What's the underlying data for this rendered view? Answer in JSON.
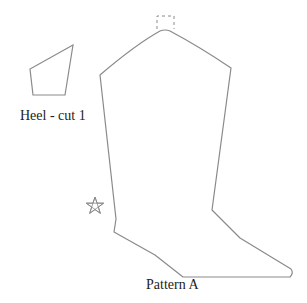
{
  "diagram": {
    "type": "sewing-pattern",
    "stroke_color": "#8a8a8a",
    "text_color": "#222222",
    "pieces": [
      {
        "name": "heel",
        "label": "Heel - cut 1",
        "shape": "quadrilateral",
        "points": [
          [
            73,
            45
          ],
          [
            30,
            69
          ],
          [
            33,
            95
          ],
          [
            65,
            95
          ]
        ]
      },
      {
        "name": "boot-pattern",
        "label": "Pattern A",
        "shape": "boot-outline",
        "notch": "dashed rectangle at top center",
        "marker": "star",
        "points": [
          [
            100,
            75
          ],
          [
            140,
            43
          ],
          [
            160,
            30
          ],
          [
            170,
            30
          ],
          [
            190,
            42
          ],
          [
            231,
            68
          ],
          [
            212,
            210
          ],
          [
            240,
            238
          ],
          [
            291,
            270
          ],
          [
            291,
            276
          ],
          [
            183,
            277
          ],
          [
            155,
            255
          ],
          [
            114,
            231
          ],
          [
            116,
            219
          ],
          [
            100,
            75
          ]
        ]
      }
    ],
    "symbols": [
      {
        "name": "star",
        "x": 95,
        "y": 206
      }
    ]
  }
}
